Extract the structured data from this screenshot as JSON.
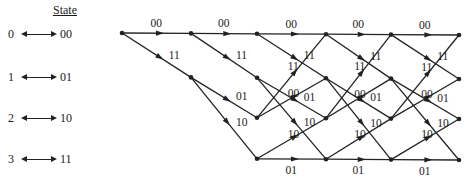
{
  "legend": {
    "title": "State",
    "states": [
      {
        "index": "0",
        "bits": "00"
      },
      {
        "index": "1",
        "bits": "01"
      },
      {
        "index": "2",
        "bits": "10"
      },
      {
        "index": "3",
        "bits": "11"
      }
    ]
  },
  "trellis": {
    "columns_x": [
      122,
      191,
      257,
      326,
      391,
      459
    ],
    "rows_y": [
      33,
      77,
      117,
      158
    ],
    "row_y_end_offset": 2,
    "line_color": "#222222",
    "transitions": [
      {
        "from": 0,
        "to": 0,
        "label": "00"
      },
      {
        "from": 0,
        "to": 1,
        "label": "11"
      },
      {
        "from": 1,
        "to": 2,
        "label": "01"
      },
      {
        "from": 1,
        "to": 3,
        "label": "10"
      },
      {
        "from": 2,
        "to": 0,
        "label": "11"
      },
      {
        "from": 2,
        "to": 1,
        "label": "00"
      },
      {
        "from": 3,
        "to": 2,
        "label": "10"
      },
      {
        "from": 3,
        "to": 3,
        "label": "01"
      }
    ],
    "stages": [
      {
        "start_states": [
          0
        ]
      },
      {
        "start_states": [
          0,
          1
        ]
      },
      {
        "start_states": [
          0,
          1,
          2,
          3
        ]
      },
      {
        "start_states": [
          0,
          1,
          2,
          3
        ]
      },
      {
        "start_states": [
          0,
          1,
          2,
          3
        ]
      }
    ]
  }
}
